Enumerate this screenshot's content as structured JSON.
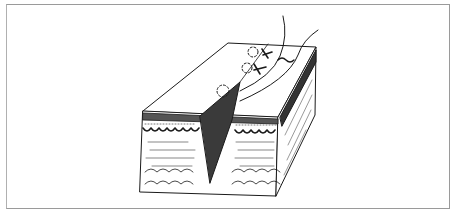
{
  "figure": {
    "elements": [
      "skin-block",
      "incision-wedge",
      "epidermis-layer",
      "dermis-layer",
      "subcutaneous-fat-layer",
      "suture-thread",
      "suture-knots",
      "needle-entry-marks"
    ],
    "colors": {
      "ink": "#1a1a1a",
      "frame": "#9a9a9a",
      "paper": "#ffffff"
    }
  }
}
